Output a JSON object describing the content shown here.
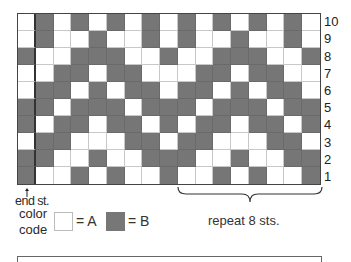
{
  "chart": {
    "title": "",
    "columns": 17,
    "rows_count": 10,
    "row_labels": [
      "10",
      "9",
      "8",
      "7",
      "6",
      "5",
      "4",
      "3",
      "2",
      "1"
    ],
    "rows": [
      "ABABABABABABABABA",
      "ABAABAABABAABAABA",
      "BAABBBAABAABBBAAB",
      "AABBABBAAABBABBAA",
      "ABBABABBABBABABBA",
      "BBABBBABBBABBBABB",
      "BABBABBABABBABBAB",
      "ABBAAABBABBAAABBA",
      "BBAABAABBBAABAABB",
      "BAABABAABAABABAAB"
    ],
    "colors": {
      "A": "#ffffff",
      "B": "#767676"
    }
  },
  "annotations": {
    "end_stitch": "end st.",
    "repeat": "repeat 8 sts.",
    "repeat_span_columns": [
      9,
      16
    ]
  },
  "legend": {
    "label_line1": "color",
    "label_line2": "code",
    "a_text": "= A",
    "b_text": "= B"
  },
  "icons": {
    "end_stitch_marker": "arrow-up-icon",
    "repeat_marker": "brace-icon"
  }
}
